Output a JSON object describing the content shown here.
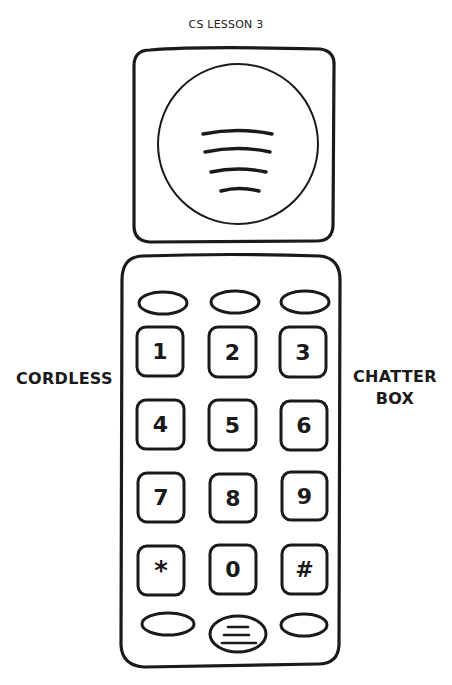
{
  "header": {
    "title": "CS LESSON 3"
  },
  "labels": {
    "left": "CORDLESS",
    "right_line1": "CHATTER",
    "right_line2": "BOX"
  },
  "phone": {
    "speaker": {
      "icon": "speaker-grille-icon",
      "lines": 4
    },
    "top_buttons": [
      "",
      "",
      ""
    ],
    "keys": [
      {
        "label": "1"
      },
      {
        "label": "2"
      },
      {
        "label": "3"
      },
      {
        "label": "4"
      },
      {
        "label": "5"
      },
      {
        "label": "6"
      },
      {
        "label": "7"
      },
      {
        "label": "8"
      },
      {
        "label": "9"
      },
      {
        "label": "*"
      },
      {
        "label": "0"
      },
      {
        "label": "#"
      }
    ],
    "bottom_buttons": [
      "",
      "menu-lines-icon",
      ""
    ],
    "stroke_color": "#1a1a1a",
    "background_color": "#ffffff"
  }
}
